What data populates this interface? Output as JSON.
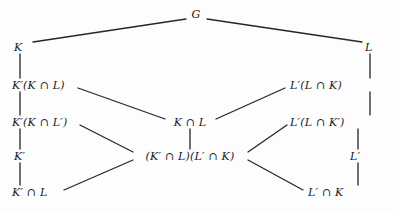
{
  "figure": {
    "kind": "lattice-hasse-diagram",
    "width": 398,
    "height": 213,
    "background_color": "#fdfdfd",
    "line_color": "#262626",
    "text_color": "#1a1a1a"
  },
  "nodes": [
    {
      "id": "G",
      "label": "G",
      "x": 196,
      "y": 14,
      "anchor": "center"
    },
    {
      "id": "K",
      "label": "K",
      "x": 14,
      "y": 47,
      "anchor": "left"
    },
    {
      "id": "L",
      "label": "L",
      "x": 365,
      "y": 47,
      "anchor": "left"
    },
    {
      "id": "KpKL",
      "label": "K′(K ∩ L)",
      "x": 12,
      "y": 85,
      "anchor": "left"
    },
    {
      "id": "LpLK",
      "label": "L′(L ∩ K)",
      "x": 290,
      "y": 85,
      "anchor": "left"
    },
    {
      "id": "KpKLp",
      "label": "K′(K ∩ L′)",
      "x": 12,
      "y": 122,
      "anchor": "left"
    },
    {
      "id": "KL",
      "label": "K ∩ L",
      "x": 190,
      "y": 122,
      "anchor": "center"
    },
    {
      "id": "LpLKp",
      "label": "L′(L ∩ K′)",
      "x": 290,
      "y": 122,
      "anchor": "left"
    },
    {
      "id": "Kp",
      "label": "K′",
      "x": 14,
      "y": 156,
      "anchor": "left"
    },
    {
      "id": "prod",
      "label": "(K′ ∩ L)(L′ ∩ K)",
      "x": 190,
      "y": 156,
      "anchor": "center"
    },
    {
      "id": "Lp",
      "label": "L′",
      "x": 350,
      "y": 156,
      "anchor": "left"
    },
    {
      "id": "KpL",
      "label": "K′ ∩ L",
      "x": 12,
      "y": 192,
      "anchor": "left"
    },
    {
      "id": "LpK",
      "label": "L′ ∩ K",
      "x": 308,
      "y": 192,
      "anchor": "left"
    }
  ],
  "edges": [
    {
      "from": "G",
      "to": "K",
      "x1": 186,
      "y1": 19,
      "x2": 33,
      "y2": 42,
      "name": "edge-g-k"
    },
    {
      "from": "G",
      "to": "L",
      "x1": 207,
      "y1": 19,
      "x2": 362,
      "y2": 42,
      "name": "edge-g-l"
    },
    {
      "from": "K",
      "to": "KpKL",
      "x1": 20,
      "y1": 54,
      "x2": 20,
      "y2": 78,
      "name": "edge-k-kpkl"
    },
    {
      "from": "L",
      "to": "LpLK",
      "x1": 370,
      "y1": 54,
      "x2": 370,
      "y2": 78,
      "name": "edge-l-lplk"
    },
    {
      "from": "KpKL",
      "to": "KL",
      "x1": 78,
      "y1": 88,
      "x2": 165,
      "y2": 119,
      "name": "edge-kpkl-kl"
    },
    {
      "from": "LpLK",
      "to": "KL",
      "x1": 285,
      "y1": 88,
      "x2": 216,
      "y2": 119,
      "name": "edge-lplk-kl"
    },
    {
      "from": "KpKL",
      "to": "KpKLp",
      "x1": 20,
      "y1": 92,
      "x2": 20,
      "y2": 115,
      "name": "edge-kpkl-kpklp"
    },
    {
      "from": "LpLK",
      "to": "LpLKp",
      "x1": 370,
      "y1": 92,
      "x2": 370,
      "y2": 115,
      "name": "edge-lplk-lplkp"
    },
    {
      "from": "KL",
      "to": "prod",
      "x1": 190,
      "y1": 129,
      "x2": 190,
      "y2": 149,
      "name": "edge-kl-prod"
    },
    {
      "from": "KpKLp",
      "to": "prod",
      "x1": 80,
      "y1": 125,
      "x2": 133,
      "y2": 152,
      "name": "edge-kpklp-prod"
    },
    {
      "from": "LpLKp",
      "to": "prod",
      "x1": 287,
      "y1": 125,
      "x2": 248,
      "y2": 152,
      "name": "edge-lplkp-prod"
    },
    {
      "from": "KpKLp",
      "to": "Kp",
      "x1": 20,
      "y1": 129,
      "x2": 20,
      "y2": 149,
      "name": "edge-kpklp-kp"
    },
    {
      "from": "LpLKp",
      "to": "Lp",
      "x1": 358,
      "y1": 129,
      "x2": 358,
      "y2": 149,
      "name": "edge-lplkp-lp"
    },
    {
      "from": "Kp",
      "to": "KpL",
      "x1": 20,
      "y1": 163,
      "x2": 20,
      "y2": 185,
      "name": "edge-kp-kpl"
    },
    {
      "from": "Lp",
      "to": "LpK",
      "x1": 358,
      "y1": 163,
      "x2": 358,
      "y2": 185,
      "name": "edge-lp-lpk"
    },
    {
      "from": "KpL",
      "to": "prod",
      "x1": 64,
      "y1": 190,
      "x2": 133,
      "y2": 160,
      "name": "edge-kpl-prod"
    },
    {
      "from": "LpK",
      "to": "prod",
      "x1": 303,
      "y1": 190,
      "x2": 248,
      "y2": 160,
      "name": "edge-lpk-prod"
    }
  ]
}
